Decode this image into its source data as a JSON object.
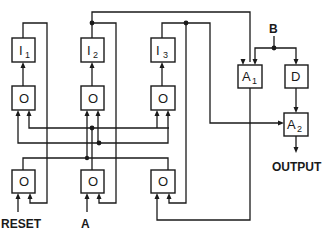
{
  "diagram": {
    "type": "logic-block-diagram",
    "blocks": {
      "i1": {
        "label": "I",
        "sub": "1"
      },
      "i2": {
        "label": "I",
        "sub": "2"
      },
      "i3": {
        "label": "I",
        "sub": "3"
      },
      "o_top_1": {
        "label": "O"
      },
      "o_top_2": {
        "label": "O"
      },
      "o_top_3": {
        "label": "O"
      },
      "o_bot_1": {
        "label": "O"
      },
      "o_bot_2": {
        "label": "O"
      },
      "o_bot_3": {
        "label": "O"
      },
      "a1": {
        "label": "A",
        "sub": "1"
      },
      "a2": {
        "label": "A",
        "sub": "2"
      },
      "d": {
        "label": "D"
      }
    },
    "inputs": {
      "reset": "RESET",
      "a": "A",
      "b": "B"
    },
    "outputs": {
      "output": "OUTPUT"
    },
    "colors": {
      "line": "#1a1a1a",
      "background": "#ffffff"
    }
  }
}
